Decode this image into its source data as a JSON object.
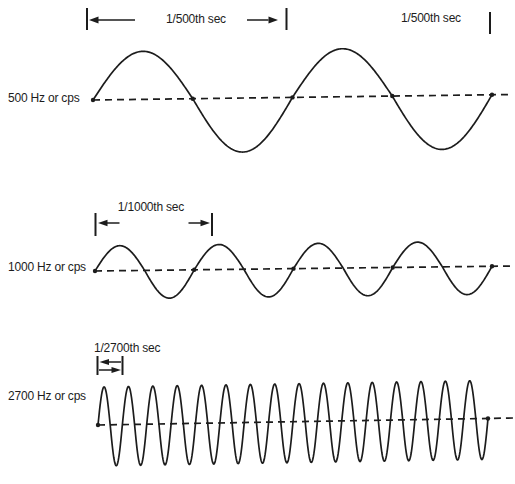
{
  "colors": {
    "ink": "#1c1c1c",
    "background": "#ffffff"
  },
  "chart_data": {
    "type": "line",
    "title": "",
    "legend": "none",
    "grid": false,
    "description_of_content": "Three sine waveforms comparing frequency and period",
    "waves": [
      {
        "frequency_hz": 500,
        "label": "500 Hz or cps",
        "period_label": "1/500th sec",
        "period_label_right": "1/500th sec",
        "cycles_shown": 2,
        "draw": {
          "x_start": 93,
          "x_end": 492,
          "baseline": {
            "x0": 93,
            "y0": 100,
            "x1": 512,
            "y1": 94.5
          },
          "amp_up": 48,
          "amp_down": 54,
          "dot_every_cycles": 0.5
        }
      },
      {
        "frequency_hz": 1000,
        "label": "1000 Hz or cps",
        "period_label": "1/1000th sec",
        "cycles_shown": 4,
        "draw": {
          "x_start": 95,
          "x_end": 492,
          "baseline": {
            "x0": 95,
            "y0": 271,
            "x1": 515,
            "y1": 266
          },
          "amp_up": 25,
          "amp_down": 28,
          "dot_every_cycles": 1
        }
      },
      {
        "frequency_hz": 2700,
        "label": "2700 Hz or cps",
        "period_label": "1/2700th sec",
        "cycles_shown": 16,
        "draw": {
          "x_start": 98,
          "x_end": 488,
          "baseline": {
            "x0": 98,
            "y0": 425,
            "x1": 514,
            "y1": 418
          },
          "amp_up": 38,
          "amp_down": 41,
          "dot_every_cycles": 16
        }
      }
    ]
  }
}
